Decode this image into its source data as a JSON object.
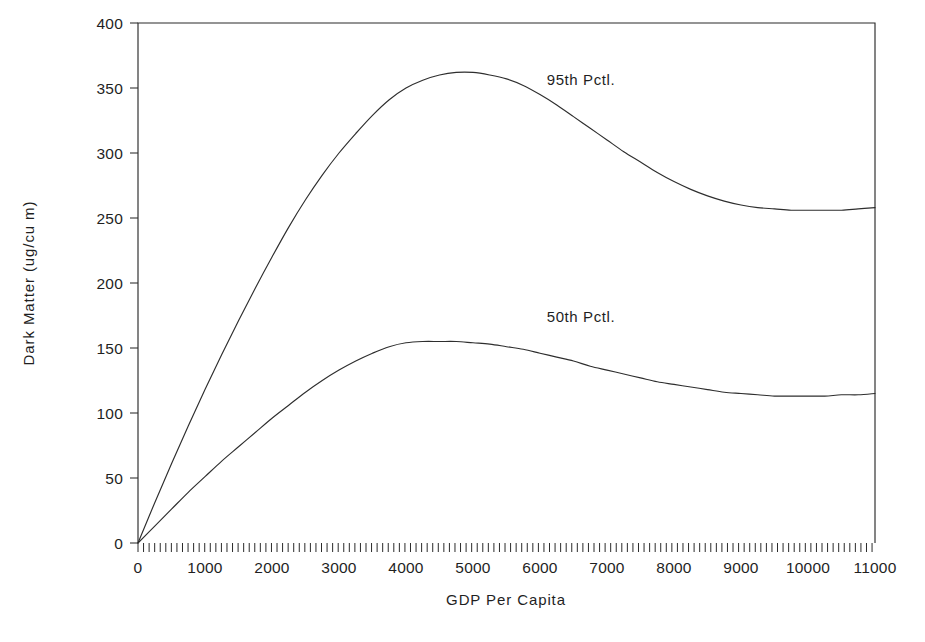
{
  "chart_data": {
    "type": "line",
    "title": "",
    "xlabel": "GDP Per Capita",
    "ylabel": "Dark Matter (ug/cu m)",
    "xlim": [
      0,
      11000
    ],
    "ylim": [
      0,
      400
    ],
    "xticks": [
      0,
      1000,
      2000,
      3000,
      4000,
      5000,
      6000,
      7000,
      8000,
      9000,
      10000,
      11000
    ],
    "yticks": [
      0,
      50,
      100,
      150,
      200,
      250,
      300,
      350,
      400
    ],
    "xticklabels": [
      "0",
      "1000",
      "2000",
      "3000",
      "4000",
      "5000",
      "6000",
      "7000",
      "8000",
      "9000",
      "10000",
      "11000"
    ],
    "yticklabels": [
      "0",
      "50",
      "100",
      "150",
      "200",
      "250",
      "300",
      "350",
      "400"
    ],
    "x_minor_tick_interval": 83,
    "grid": false,
    "legend_position": "inline-annotations",
    "frame": "box",
    "line_color": "#2e2e2e",
    "axis_color": "#2b2b2b",
    "background_color": "#ffffff",
    "x": [
      0,
      250,
      500,
      750,
      1000,
      1250,
      1500,
      1750,
      2000,
      2250,
      2500,
      2750,
      3000,
      3250,
      3500,
      3750,
      4000,
      4250,
      4500,
      4750,
      5000,
      5250,
      5500,
      5750,
      6000,
      6250,
      6500,
      6750,
      7000,
      7250,
      7500,
      7750,
      8000,
      8250,
      8500,
      8750,
      9000,
      9250,
      9500,
      9750,
      10000,
      10250,
      10500,
      10750,
      11000
    ],
    "series": [
      {
        "name": "95th Pctl.",
        "label": "95th Pctl.",
        "label_x": 6100,
        "label_y": 352,
        "peak_x": 5100,
        "peak_y": 362,
        "end_y": 257,
        "values": [
          0,
          31,
          61,
          90,
          118,
          145,
          171,
          196,
          220,
          243,
          264,
          283,
          300,
          315,
          329,
          341,
          350,
          356,
          360,
          362,
          362,
          360,
          357,
          352,
          345,
          337,
          328,
          319,
          310,
          301,
          293,
          285,
          278,
          272,
          267,
          263,
          260,
          258,
          257,
          256,
          256,
          256,
          256,
          257,
          258
        ]
      },
      {
        "name": "50th Pctl.",
        "label": "50th Pctl.",
        "label_x": 6100,
        "label_y": 170,
        "peak_x": 4700,
        "peak_y": 155,
        "end_y": 115,
        "values": [
          0,
          13,
          26,
          39,
          51,
          63,
          74,
          85,
          96,
          106,
          116,
          125,
          133,
          140,
          146,
          151,
          154,
          155,
          155,
          155,
          154,
          153,
          151,
          149,
          146,
          143,
          140,
          136,
          133,
          130,
          127,
          124,
          122,
          120,
          118,
          116,
          115,
          114,
          113,
          113,
          113,
          113,
          114,
          114,
          115
        ]
      }
    ]
  },
  "plot_geometry": {
    "left": 138,
    "right": 875,
    "top": 23,
    "bottom": 543
  }
}
